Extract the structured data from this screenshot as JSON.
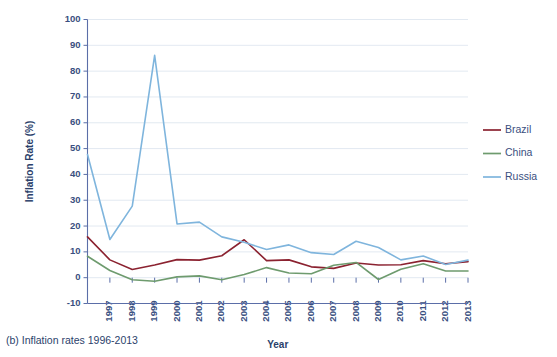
{
  "caption": "(b) Inflation rates 1996-2013",
  "axis_title_y": "Inflation Rate (%)",
  "axis_title_x": "Year",
  "legend": {
    "items": [
      {
        "label": "Brazil",
        "color": "#8B2230"
      },
      {
        "label": "China",
        "color": "#6E9B6E"
      },
      {
        "label": "Russia",
        "color": "#7FB5DD"
      }
    ]
  },
  "chart_data": {
    "type": "line",
    "title": "(b) Inflation rates 1996-2013",
    "xlabel": "Year",
    "ylabel": "Inflation Rate (%)",
    "xlim": [
      1996,
      2013
    ],
    "ylim": [
      -10,
      100
    ],
    "ytick_values": [
      -10,
      0,
      10,
      20,
      30,
      40,
      50,
      60,
      70,
      80,
      90,
      100
    ],
    "ytick_labels": [
      "-10",
      "0",
      "10",
      "20",
      "30",
      "40",
      "50",
      "60",
      "70",
      "80",
      "90",
      "100"
    ],
    "xtick_values": [
      1997,
      1998,
      1999,
      2000,
      2001,
      2002,
      2003,
      2004,
      2005,
      2006,
      2007,
      2008,
      2009,
      2010,
      2011,
      2012,
      2013
    ],
    "xtick_labels": [
      "1997",
      "1998",
      "1999",
      "2000",
      "2001",
      "2002",
      "2003",
      "2004",
      "2005",
      "2006",
      "2007",
      "2008",
      "2009",
      "2010",
      "2011",
      "2012",
      "2013"
    ],
    "xtick_rotation": 90,
    "grid": "horizontal",
    "legend_position": "right",
    "x": [
      1996,
      1997,
      1998,
      1999,
      2000,
      2001,
      2002,
      2003,
      2004,
      2005,
      2006,
      2007,
      2008,
      2009,
      2010,
      2011,
      2012,
      2013
    ],
    "series": [
      {
        "name": "Brazil",
        "color": "#8B2230",
        "values": [
          15.8,
          6.9,
          3.2,
          4.9,
          7.0,
          6.8,
          8.5,
          14.7,
          6.6,
          6.9,
          4.2,
          3.6,
          5.7,
          4.9,
          5.0,
          6.6,
          5.4,
          6.2
        ]
      },
      {
        "name": "China",
        "color": "#6E9B6E",
        "values": [
          8.3,
          2.8,
          -0.8,
          -1.4,
          0.3,
          0.7,
          -0.8,
          1.2,
          3.9,
          1.8,
          1.5,
          4.8,
          5.9,
          -0.7,
          3.3,
          5.4,
          2.6,
          2.6
        ]
      },
      {
        "name": "Russia",
        "color": "#7FB5DD",
        "values": [
          47.7,
          14.8,
          27.7,
          86.1,
          20.8,
          21.5,
          15.8,
          13.7,
          10.9,
          12.7,
          9.7,
          9.0,
          14.1,
          11.7,
          6.9,
          8.4,
          5.1,
          6.8
        ]
      }
    ]
  }
}
